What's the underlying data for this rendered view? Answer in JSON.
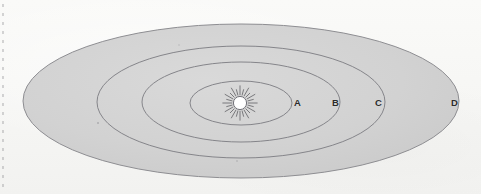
{
  "figure": {
    "background_color": "#f8f8f6",
    "orbit_fill_color": "#d2d2d2",
    "orbit_stroke_color": "#8a8a8e",
    "label_color": "#2b2b2b",
    "sun_color": "#ffffff",
    "sun_ray_color": "#6e6e72"
  },
  "sun": {
    "name": "sun",
    "cx": 240,
    "cy": 103,
    "radius": 7,
    "ray_count": 24,
    "ray_length": 9
  },
  "orbits": [
    {
      "label": "A",
      "cx": 241,
      "cy": 103,
      "rx": 51,
      "ry": 22,
      "label_x": 294,
      "label_y": 98
    },
    {
      "label": "B",
      "cx": 241,
      "cy": 102,
      "rx": 99,
      "ry": 40,
      "label_x": 332,
      "label_y": 98
    },
    {
      "label": "C",
      "cx": 241,
      "cy": 102,
      "rx": 144,
      "ry": 56,
      "label_x": 375,
      "label_y": 98
    },
    {
      "label": "D",
      "cx": 241,
      "cy": 101,
      "rx": 218,
      "ry": 77,
      "label_x": 451,
      "label_y": 98
    }
  ],
  "annotations": {
    "edge_marks": "dashed-left-edge-artifact"
  },
  "chart_data": {
    "type": "scatter",
    "xlabel": "",
    "ylabel": "",
    "categories": [
      "A",
      "B",
      "C",
      "D"
    ],
    "values": [
      51,
      99,
      144,
      218
    ],
    "series": [
      {
        "name": "semi-major axis (px)",
        "values": [
          51,
          99,
          144,
          218
        ]
      },
      {
        "name": "semi-minor axis (px)",
        "values": [
          22,
          40,
          56,
          77
        ]
      }
    ],
    "annotations": [
      "A",
      "B",
      "C",
      "D"
    ],
    "legend": "none",
    "grid": false
  }
}
